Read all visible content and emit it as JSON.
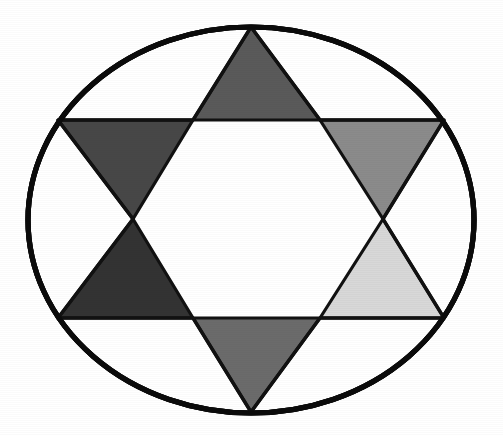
{
  "figure": {
    "title": "Hexagram inscribed in an ellipse",
    "background_color": "#ffffff",
    "canvas": {
      "width": 503,
      "height": 435
    }
  },
  "outline": {
    "shape_name": "ellipse",
    "center_x": 251,
    "center_y": 220,
    "radius_x": 223,
    "radius_y": 193,
    "stroke_color": "#0b0b0b",
    "stroke_width": 5.2,
    "fill": "none"
  },
  "inner_hexagon": {
    "shape_name": "hexagon",
    "fill_color": "#ffffff",
    "points": "193,120 320,120 383,219 320,318 193,318 133,219"
  },
  "star_outline": {
    "shape_name": "hexagram-outline",
    "stroke_color": "#111111",
    "points": "251,27 320,120 444,120 383,219 444,318 320,318 251,412 193,318 58,318 133,219 58,120 193,120"
  },
  "points": [
    {
      "id": "top",
      "label": "Top point",
      "fill_color": "#5a5a5a",
      "polygon": "251,27 320,120 193,120",
      "direction": "up"
    },
    {
      "id": "upper-left",
      "label": "Upper-left point",
      "fill_color": "#474747",
      "polygon": "58,120 193,120 133,219",
      "direction": "down-left"
    },
    {
      "id": "upper-right",
      "label": "Upper-right point",
      "fill_color": "#8b8b8b",
      "polygon": "320,120 444,120 383,219",
      "direction": "down-right"
    },
    {
      "id": "lower-left",
      "label": "Lower-left point",
      "fill_color": "#333333",
      "polygon": "133,219 193,318 58,318",
      "direction": "up-left"
    },
    {
      "id": "lower-right",
      "label": "Lower-right point",
      "fill_color": "#d8d8d8",
      "polygon": "383,219 444,318 320,318",
      "direction": "up-right"
    },
    {
      "id": "bottom",
      "label": "Bottom point",
      "fill_color": "#6b6b6b",
      "polygon": "193,318 320,318 251,412",
      "direction": "down"
    }
  ]
}
